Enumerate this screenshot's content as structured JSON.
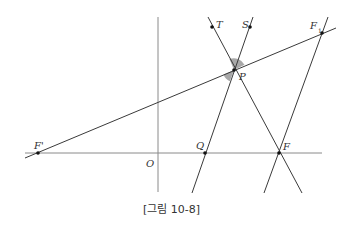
{
  "figure": {
    "caption": "[그림 10-8]",
    "colors": {
      "axis": "#8a8a8a",
      "line": "#3a3a3a",
      "point": "#111111",
      "angle_fill": "#a8a8a8",
      "background": "#ffffff"
    },
    "points": {
      "F_prime": {
        "label": "F'",
        "x": 38,
        "y": 153
      },
      "O": {
        "label": "O",
        "x": 158,
        "y": 153
      },
      "Q": {
        "label": "Q",
        "x": 205,
        "y": 153
      },
      "F": {
        "label": "F",
        "x": 279,
        "y": 153
      },
      "P": {
        "label": "P",
        "x": 234,
        "y": 70
      },
      "T": {
        "label": "T",
        "x": 212,
        "y": 27
      },
      "S": {
        "label": "S",
        "x": 250,
        "y": 27
      },
      "F1": {
        "label": "F",
        "subscript": "1",
        "x": 322,
        "y": 33
      }
    },
    "lines": [
      {
        "name": "x-axis",
        "from": [
          25,
          153
        ],
        "to": [
          322,
          153
        ]
      },
      {
        "name": "y-axis",
        "from": [
          158,
          17
        ],
        "to": [
          158,
          192
        ]
      },
      {
        "name": "line-Fprime-F1",
        "from": [
          25,
          158
        ],
        "to": [
          336,
          28
        ]
      },
      {
        "name": "line-T-F",
        "from": [
          208,
          17
        ],
        "to": [
          302,
          193
        ]
      },
      {
        "name": "line-S-Q",
        "from": [
          253,
          17
        ],
        "to": [
          192,
          193
        ]
      },
      {
        "name": "line-F1-F",
        "from": [
          328,
          17
        ],
        "to": [
          264,
          193
        ]
      }
    ]
  }
}
